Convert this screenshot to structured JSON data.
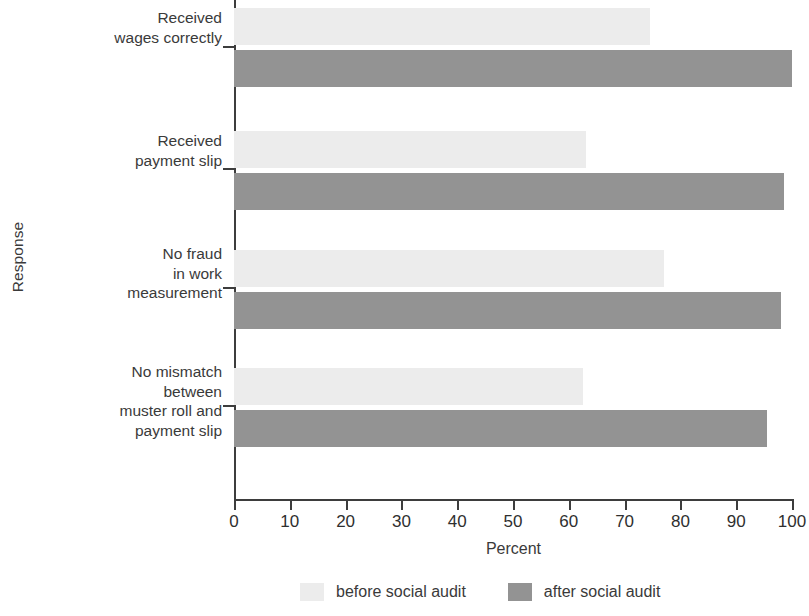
{
  "chart_data": {
    "type": "bar",
    "orientation": "horizontal",
    "title": "",
    "xlabel": "Percent",
    "ylabel": "Response",
    "xlim": [
      0,
      100
    ],
    "xticks": [
      0,
      10,
      20,
      30,
      40,
      50,
      60,
      70,
      80,
      90,
      100
    ],
    "xticklabels": [
      "0",
      "10",
      "20",
      "30",
      "40",
      "50",
      "60",
      "70",
      "80",
      "90",
      "100"
    ],
    "grid": false,
    "legend_position": "bottom",
    "categories": [
      "Received\nwages correctly",
      "Received\npayment slip",
      "No fraud\nin work\nmeasurement",
      "No mismatch\nbetween\nmuster roll and\npayment slip"
    ],
    "series": [
      {
        "name": "before social audit",
        "color": "#ececec",
        "values": [
          74.5,
          63,
          77,
          62.5
        ]
      },
      {
        "name": "after social audit",
        "color": "#939393",
        "values": [
          100,
          98.5,
          98,
          95.5
        ]
      }
    ]
  },
  "legend": {
    "items": [
      {
        "label": "before social audit",
        "swatch": "before"
      },
      {
        "label": "after social audit",
        "swatch": "after"
      }
    ]
  }
}
